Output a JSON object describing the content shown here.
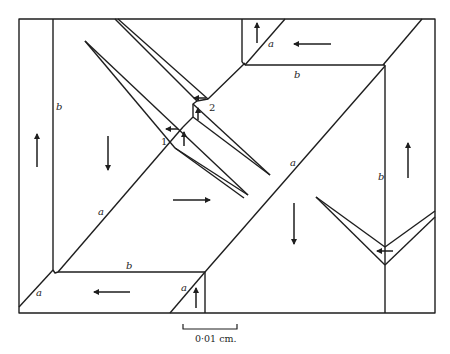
{
  "figure": {
    "line_color": "#1e1e1e",
    "background": "#ffffff"
  },
  "labels": {
    "a_main_upper": "a",
    "a_main_lower": "a",
    "a_top_right": "a",
    "a_bottom_left": "a",
    "a_bottom_mid": "a",
    "b_left": "b",
    "b_top": "b",
    "b_bottom": "b",
    "b_right": "b",
    "junction_1": "1",
    "junction_2": "2"
  },
  "scale_bar": {
    "label": "0·01 cm."
  },
  "arrows": [
    {
      "id": "left-band",
      "direction": "up"
    },
    {
      "id": "left-domain",
      "direction": "down"
    },
    {
      "id": "center-domain",
      "direction": "right"
    },
    {
      "id": "lower-center-domain",
      "direction": "down"
    },
    {
      "id": "right-band",
      "direction": "up"
    },
    {
      "id": "top-band",
      "direction": "left"
    },
    {
      "id": "top-left-corner",
      "direction": "up"
    },
    {
      "id": "bottom-band",
      "direction": "left"
    },
    {
      "id": "bottom-corner",
      "direction": "up"
    },
    {
      "id": "junction-1-left",
      "direction": "left"
    },
    {
      "id": "junction-1-up",
      "direction": "up"
    },
    {
      "id": "junction-2-left",
      "direction": "left"
    },
    {
      "id": "junction-2-up",
      "direction": "up"
    },
    {
      "id": "right-v-wedge",
      "direction": "left"
    }
  ]
}
